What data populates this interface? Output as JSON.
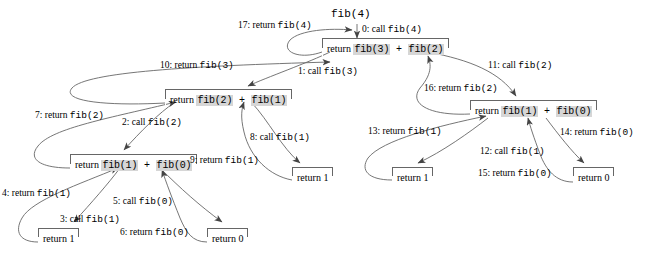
{
  "diagram": {
    "root_label": "fib(4)",
    "highlight_color": "#d6d6d6",
    "line_color": "#666666",
    "nodes": [
      {
        "id": "n_fib4",
        "text_before": "return ",
        "call_a": "fib(3)",
        "op": " + ",
        "call_b": "fib(2)",
        "x": 322,
        "y": 38,
        "w": 112
      },
      {
        "id": "n_fib3",
        "text_before": "return ",
        "call_a": "fib(2)",
        "op": " + ",
        "call_b": "fib(1)",
        "x": 165,
        "y": 89,
        "w": 112
      },
      {
        "id": "n_fib2L",
        "text_before": "return ",
        "call_a": "fib(1)",
        "op": " + ",
        "call_b": "fib(0)",
        "x": 70,
        "y": 154,
        "w": 112
      },
      {
        "id": "n_fib2R",
        "text_before": "return ",
        "call_a": "fib(1)",
        "op": " + ",
        "call_b": "fib(0)",
        "x": 470,
        "y": 100,
        "w": 112
      }
    ],
    "leaves": [
      {
        "id": "leaf_1a",
        "text": "return 1",
        "x": 38,
        "y": 228,
        "w": 52
      },
      {
        "id": "leaf_0a",
        "text": "return 0",
        "x": 207,
        "y": 228,
        "w": 52
      },
      {
        "id": "leaf_1b",
        "text": "return 1",
        "x": 292,
        "y": 167,
        "w": 52
      },
      {
        "id": "leaf_1c",
        "text": "return 1",
        "x": 392,
        "y": 167,
        "w": 52
      },
      {
        "id": "leaf_0b",
        "text": "return 0",
        "x": 573,
        "y": 167,
        "w": 52
      }
    ],
    "edge_labels": [
      {
        "id": "lbl_0",
        "prefix": "0: call ",
        "code": "fib(4)",
        "x": 362,
        "y": 24
      },
      {
        "id": "lbl_17",
        "prefix": "17: return ",
        "code": "fib(4)",
        "x": 238,
        "y": 20
      },
      {
        "id": "lbl_1",
        "prefix": "1: call ",
        "code": "fib(3)",
        "x": 298,
        "y": 66
      },
      {
        "id": "lbl_10",
        "prefix": "10: return ",
        "code": "fib(3)",
        "x": 160,
        "y": 60
      },
      {
        "id": "lbl_11",
        "prefix": "11: call ",
        "code": "fib(2)",
        "x": 488,
        "y": 60
      },
      {
        "id": "lbl_16",
        "prefix": "16: return ",
        "code": "fib(2)",
        "x": 424,
        "y": 83
      },
      {
        "id": "lbl_2",
        "prefix": "2: call ",
        "code": "fib(2)",
        "x": 122,
        "y": 117
      },
      {
        "id": "lbl_7",
        "prefix": "7: return ",
        "code": "fib(2)",
        "x": 35,
        "y": 110
      },
      {
        "id": "lbl_8",
        "prefix": "8: call ",
        "code": "fib(1)",
        "x": 250,
        "y": 132
      },
      {
        "id": "lbl_9",
        "prefix": "9: return ",
        "code": "fib(1)",
        "x": 190,
        "y": 155
      },
      {
        "id": "lbl_3",
        "prefix": "3: call ",
        "code": "fib(1)",
        "x": 60,
        "y": 214
      },
      {
        "id": "lbl_4",
        "prefix": "4: return ",
        "code": "fib(1)",
        "x": 2,
        "y": 188
      },
      {
        "id": "lbl_5",
        "prefix": "5: call ",
        "code": "fib(0)",
        "x": 113,
        "y": 196
      },
      {
        "id": "lbl_6",
        "prefix": "6: return ",
        "code": "fib(0)",
        "x": 120,
        "y": 227
      },
      {
        "id": "lbl_12",
        "prefix": "12: call ",
        "code": "fib(1)",
        "x": 480,
        "y": 146
      },
      {
        "id": "lbl_13",
        "prefix": "13: return ",
        "code": "fib(1)",
        "x": 368,
        "y": 126
      },
      {
        "id": "lbl_14",
        "prefix": "14: return ",
        "code": "fib(0)",
        "x": 560,
        "y": 127
      },
      {
        "id": "lbl_15",
        "prefix": "15: return ",
        "code": "fib(0)",
        "x": 478,
        "y": 168
      }
    ]
  }
}
